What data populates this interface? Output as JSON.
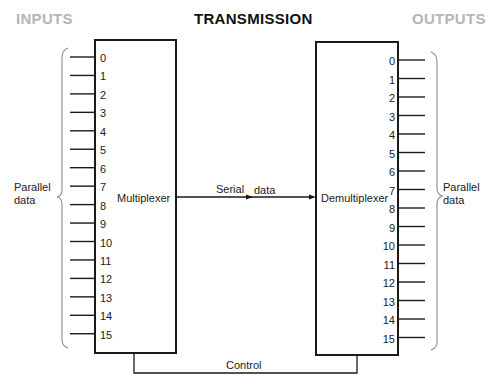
{
  "headers": {
    "inputs": "INPUTS",
    "transmission": "TRANSMISSION",
    "outputs": "OUTPUTS"
  },
  "left": {
    "group_label_line1": "Parallel",
    "group_label_line2": "data",
    "block_label": "Multiplexer",
    "pins": [
      "0",
      "1",
      "2",
      "3",
      "4",
      "5",
      "6",
      "7",
      "8",
      "9",
      "10",
      "11",
      "12",
      "13",
      "14",
      "15"
    ]
  },
  "right": {
    "group_label_line1": "Parallel",
    "group_label_line2": "data",
    "block_label": "Demultiplexer",
    "pins": [
      "0",
      "1",
      "2",
      "3",
      "4",
      "5",
      "6",
      "7",
      "8",
      "9",
      "10",
      "11",
      "12",
      "13",
      "14",
      "15"
    ]
  },
  "link": {
    "serial_word1": "Serial",
    "serial_word2": "data",
    "control": "Control"
  },
  "colors": {
    "line": "#1a1a1a",
    "bracket": "#8a8a8a",
    "faded_header": "#b5b5b5"
  }
}
